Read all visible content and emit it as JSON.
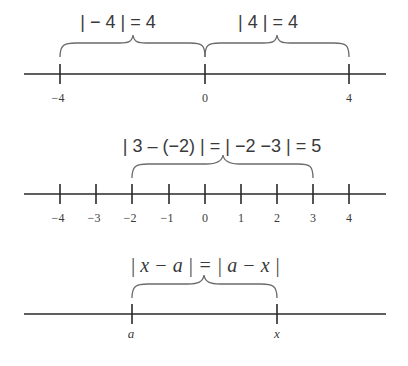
{
  "diagram": {
    "panels": [
      {
        "id": "panel-1",
        "expressions": [
          "|− 4| = 4",
          "|4| = 4"
        ],
        "tick_labels": [
          "−4",
          "0",
          "4"
        ],
        "brace_spans": [
          [
            "-4",
            "0"
          ],
          [
            "0",
            "4"
          ]
        ]
      },
      {
        "id": "panel-2",
        "expression": "|3 − (−2)| = |−2 −3| = 5",
        "tick_labels": [
          "−4",
          "−3",
          "−2",
          "−1",
          "0",
          "1",
          "2",
          "3",
          "4"
        ],
        "brace_span": [
          "-2",
          "3"
        ]
      },
      {
        "id": "panel-3",
        "expression": "|x − a| = |a − x|",
        "tick_labels": [
          "a",
          "x"
        ],
        "brace_span": [
          "a",
          "x"
        ]
      }
    ]
  },
  "labels": {
    "p1_left": "| − 4 | = 4",
    "p1_right": "| 4 | = 4",
    "p1_t0": "−4",
    "p1_t1": "0",
    "p1_t2": "4",
    "p2_expr": "| 3 – (−2) | = | −2 −3 | = 5",
    "p2_t0": "−4",
    "p2_t1": "−3",
    "p2_t2": "−2",
    "p2_t3": "−1",
    "p2_t4": "0",
    "p2_t5": "1",
    "p2_t6": "2",
    "p2_t7": "3",
    "p2_t8": "4",
    "p3_expr": "| x − a | = | a − x |",
    "p3_a": "a",
    "p3_x": "x"
  }
}
